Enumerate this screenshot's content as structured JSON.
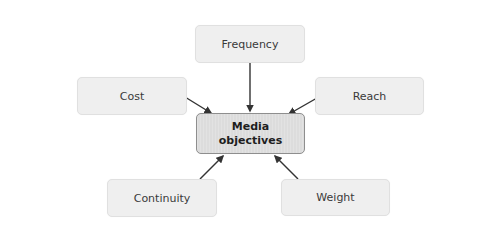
{
  "diagram": {
    "type": "hub-and-spoke",
    "center": {
      "label_line1": "Media",
      "label_line2": "objectives"
    },
    "nodes": [
      {
        "id": "frequency",
        "label": "Frequency"
      },
      {
        "id": "cost",
        "label": "Cost"
      },
      {
        "id": "reach",
        "label": "Reach"
      },
      {
        "id": "continuity",
        "label": "Continuity"
      },
      {
        "id": "weight",
        "label": "Weight"
      }
    ],
    "edges": [
      {
        "from": "frequency",
        "to": "center"
      },
      {
        "from": "cost",
        "to": "center"
      },
      {
        "from": "reach",
        "to": "center"
      },
      {
        "from": "continuity",
        "to": "center"
      },
      {
        "from": "weight",
        "to": "center"
      }
    ],
    "colors": {
      "node_fill": "#efefef",
      "center_fill": "#dcdcdc",
      "center_border": "#8e8e8e",
      "arrow": "#333333",
      "text": "#3a3a3a"
    }
  }
}
